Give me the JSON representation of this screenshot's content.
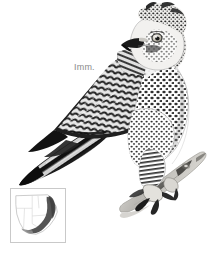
{
  "plate": {
    "width": 220,
    "height": 255,
    "background_color": "#ffffff",
    "subject_common_name": "Crowned Eagle",
    "illustration_type": "field-guide bird plate",
    "media": "monochrome / greyscale painting"
  },
  "labels": {
    "age_label": "Imm.",
    "age_label_color": "#8a8a8a"
  },
  "bird": {
    "name": "perched-eagle-illustration",
    "pose": "perched on branch, facing right, wings folded, long tail to lower-left",
    "plumage_notes": "pale spotted underparts, heavily barred wings, crested head, dark hooked bill, pale eye, barred legs and large talons",
    "palette": {
      "darkest": "#111111",
      "dark": "#2e2e2e",
      "mid": "#6b6b6b",
      "light": "#b5b5b5",
      "pale": "#e4e4e4",
      "white": "#ffffff"
    }
  },
  "branch": {
    "name": "perch-branch",
    "description": "pale grey-brown branch running from lower-left to upper-right under the talons",
    "color": "#c8c6c1"
  },
  "range_map": {
    "title": "distribution map",
    "region": "southern Africa",
    "frame_color": "#c9c9c9",
    "land_outline_color": "#bdbdbd",
    "country_border_color": "#d5d5d5",
    "range_fill_color": "#555555",
    "range_description": "dark shading along the eastern escarpment and east coast, curving west along the south coast",
    "background_color": "#ffffff"
  }
}
